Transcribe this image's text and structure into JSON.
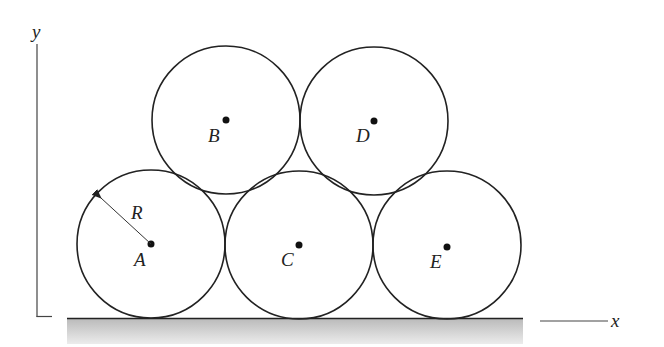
{
  "figure": {
    "axes": {
      "x_label": "x",
      "y_label": "y"
    },
    "radius_label": "R",
    "circles": [
      {
        "id": "A",
        "label": "A",
        "cx": 151,
        "cy": 244
      },
      {
        "id": "C",
        "label": "C",
        "cx": 299,
        "cy": 245
      },
      {
        "id": "E",
        "label": "E",
        "cx": 447,
        "cy": 245
      },
      {
        "id": "B",
        "label": "B",
        "cx": 226,
        "cy": 120
      },
      {
        "id": "D",
        "label": "D",
        "cx": 374,
        "cy": 121
      }
    ],
    "radius_px": 74,
    "colors": {
      "stroke": "#222222",
      "ground_top": "#bdbdbd",
      "ground_bottom": "#e6e6e6"
    }
  }
}
